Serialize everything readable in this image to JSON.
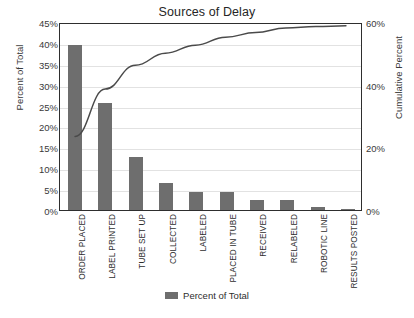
{
  "chart_data": {
    "type": "bar",
    "title": "Sources of Delay",
    "xlabel": "",
    "ylabel": "Percent of Total",
    "y2label": "Cumulative Percent",
    "ylim": [
      0,
      45
    ],
    "y2lim": [
      0,
      100
    ],
    "grid": true,
    "legend_position": "bottom",
    "categories": [
      "ORDER PLACED",
      "LABEL PRINTED",
      "TUBE SET UP",
      "COLLECTED",
      "LABELED",
      "PLACED IN TUBE",
      "RECEIVED",
      "RELABELED",
      "ROBOTIC LINE",
      "RESULTS POSTED"
    ],
    "series": [
      {
        "name": "Percent of Total",
        "type": "bar",
        "color": "#6e6e6e",
        "axis": "left",
        "values": [
          39.5,
          25.5,
          12.8,
          6.5,
          4.3,
          4.3,
          2.5,
          2.5,
          0.8,
          0.3
        ]
      },
      {
        "name": "Cumulative Percent",
        "type": "line",
        "color": "#4a4a4a",
        "axis": "right",
        "values": [
          39.5,
          65.0,
          77.8,
          84.3,
          88.6,
          92.9,
          95.4,
          97.9,
          98.7,
          99.0
        ]
      }
    ],
    "y_ticks": [
      "0%",
      "5%",
      "10%",
      "15%",
      "20%",
      "25%",
      "30%",
      "35%",
      "40%",
      "45%"
    ],
    "y_tick_values": [
      0,
      5,
      10,
      15,
      20,
      25,
      30,
      35,
      40,
      45
    ],
    "y2_ticks": [
      "0%",
      "20%",
      "40%",
      "60%",
      "80%",
      "90%",
      "100%"
    ],
    "y2_tick_positions": [
      0,
      15,
      30,
      45,
      60,
      75,
      90
    ]
  },
  "legend": {
    "items": [
      {
        "label": "Percent of Total",
        "color": "#6e6e6e"
      }
    ]
  }
}
